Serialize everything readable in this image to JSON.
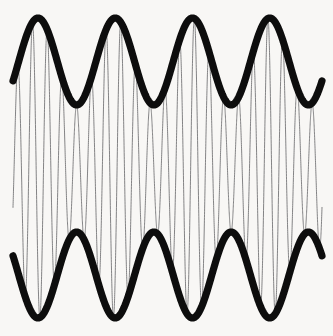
{
  "figure": {
    "kind": "waveform-plot",
    "title": "",
    "background_color": "#f8f7f5",
    "width": 333,
    "height": 336,
    "axes_visible": false,
    "gridlines_visible": false,
    "legend_visible": false,
    "tick_labels_visible": false,
    "border_visible": false
  },
  "chart_data": {
    "type": "line",
    "title": "",
    "subtitle": "",
    "xlabel": "",
    "ylabel": "",
    "xlim": [
      0,
      1
    ],
    "ylim": [
      -1.1,
      1.1
    ],
    "grid": false,
    "legend_position": "none",
    "annotations": [],
    "plot_area_px": {
      "left": 13,
      "right": 322,
      "top": 14,
      "bottom": 322
    },
    "series": [
      {
        "name": "upper-envelope",
        "role": "envelope",
        "color": "#0d0d0d",
        "line_width_px": 7.2,
        "style": "solid",
        "form": "cosine",
        "cycles": 4,
        "amplitude_norm": 0.28,
        "offset_norm": 0.72,
        "phase_deg": 0,
        "y_peak_px": 18,
        "y_valley_px": 105,
        "start_px": [
          13,
          73
        ],
        "end_px": [
          322,
          78
        ],
        "peaks_x_px": [
          38,
          113,
          188,
          265
        ],
        "valleys_x_px": [
          76,
          151,
          226,
          302
        ]
      },
      {
        "name": "lower-envelope",
        "role": "envelope",
        "color": "#0d0d0d",
        "line_width_px": 7.2,
        "style": "solid",
        "form": "cosine-mirrored",
        "cycles": 4,
        "amplitude_norm": 0.28,
        "offset_norm": -0.72,
        "phase_deg": 180,
        "y_trough_px": 318,
        "y_crest_px": 232,
        "start_px": [
          13,
          263
        ],
        "end_px": [
          322,
          257
        ],
        "troughs_x_px": [
          40,
          115,
          190,
          265
        ],
        "crests_x_px": [
          76,
          151,
          226,
          302
        ]
      },
      {
        "name": "carrier",
        "role": "carrier",
        "color": "#6e6e70",
        "line_width_px": 0.85,
        "style": "solid",
        "form": "sine",
        "cycles": 21,
        "midline_px": 168,
        "crossings_visible": 43,
        "modulated_by": "upper-envelope"
      }
    ]
  }
}
